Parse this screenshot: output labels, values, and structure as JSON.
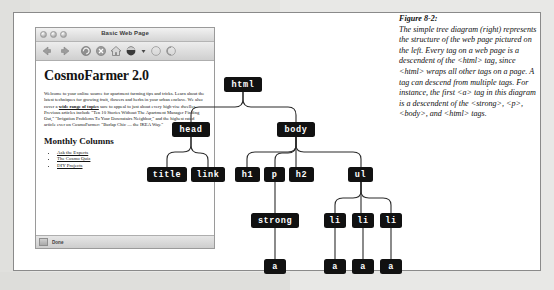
{
  "browser": {
    "window_title": "Basic Web Page",
    "traffic_lights": [
      "close",
      "minimize",
      "zoom"
    ],
    "toolbar_icons": [
      "back-icon",
      "forward-icon",
      "reload-icon",
      "stop-icon",
      "home-icon",
      "bookmarks-icon",
      "dropdown-icon",
      "blank-icon",
      "search-icon"
    ],
    "status_text": "Done"
  },
  "webpage": {
    "heading": "CosmoFarmer 2.0",
    "paragraph_part1": "Welcome to your online source for apartment farming tips and tricks. Learn about the latest techniques for growing fruit, flowers and herbs in your urban enclave. We also cover a ",
    "paragraph_link": "wide range of topics",
    "paragraph_part2": " sure to appeal to just about every high-rise dweller. Previous articles include \"Ten 10 Stories Without The Apartment Manager Finding Out,\" \"Irrigation Problems To Your Downstairs Neighbor,\" and the highest rated article ever on CosmoFarmer: \"Burlap Chic — the IKEA Way.\"",
    "subheading": "Monthly Columns",
    "links": [
      "Ask the Experts",
      "The Cosmo Quiz",
      "DIY Projects"
    ]
  },
  "tree": {
    "nodes": [
      {
        "id": "html",
        "label": "html",
        "x": 85,
        "y": 50,
        "w": 38
      },
      {
        "id": "head",
        "label": "head",
        "x": 33,
        "y": 95,
        "w": 38
      },
      {
        "id": "body",
        "label": "body",
        "x": 138,
        "y": 95,
        "w": 38
      },
      {
        "id": "title",
        "label": "title",
        "x": 8,
        "y": 140,
        "w": 40
      },
      {
        "id": "link",
        "label": "link",
        "x": 52,
        "y": 140,
        "w": 34
      },
      {
        "id": "h1",
        "label": "h1",
        "x": 96,
        "y": 140,
        "w": 25
      },
      {
        "id": "p",
        "label": "p",
        "x": 125,
        "y": 140,
        "w": 21
      },
      {
        "id": "h2",
        "label": "h2",
        "x": 150,
        "y": 140,
        "w": 25
      },
      {
        "id": "ul",
        "label": "ul",
        "x": 209,
        "y": 140,
        "w": 25
      },
      {
        "id": "strong",
        "label": "strong",
        "x": 112,
        "y": 186,
        "w": 48
      },
      {
        "id": "li1",
        "label": "li",
        "x": 185,
        "y": 186,
        "w": 22
      },
      {
        "id": "li2",
        "label": "li",
        "x": 213,
        "y": 186,
        "w": 22
      },
      {
        "id": "li3",
        "label": "li",
        "x": 241,
        "y": 186,
        "w": 22
      },
      {
        "id": "a1",
        "label": "a",
        "x": 123,
        "y": 232,
        "w": 22
      },
      {
        "id": "a2",
        "label": "a",
        "x": 185,
        "y": 232,
        "w": 22
      },
      {
        "id": "a3",
        "label": "a",
        "x": 213,
        "y": 232,
        "w": 22
      },
      {
        "id": "a4",
        "label": "a",
        "x": 241,
        "y": 232,
        "w": 22
      }
    ]
  },
  "caption": {
    "figure_number": "Figure 8-2:",
    "text": "The simple tree diagram (right) represents the structure of the web page pictured on the left. Every tag on a web page is a descendent of the <html> tag, since <html> wraps all other tags on a page. A tag can descend from multiple tags. For instance, the first <a> tag in this diagram is a descendent of the <strong>, <p>, <body>, and <html> tags."
  }
}
